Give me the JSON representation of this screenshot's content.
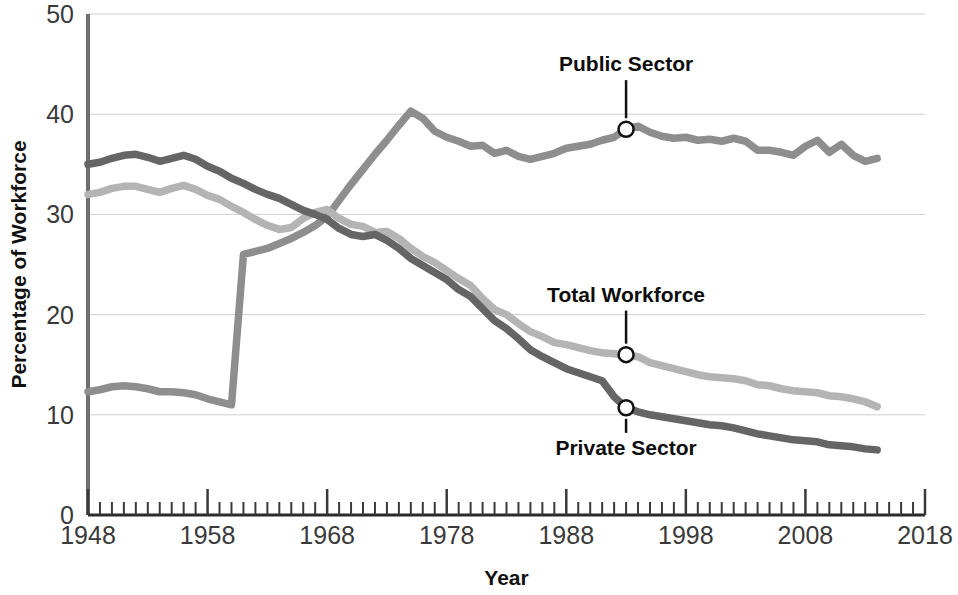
{
  "chart_data": {
    "type": "line",
    "title": "",
    "subtitle": "",
    "xlabel": "Year",
    "ylabel": "Percentage of Workforce",
    "xlim": [
      1948,
      2018
    ],
    "ylim": [
      0,
      50
    ],
    "x_major_ticks": [
      1948,
      1958,
      1968,
      1978,
      1988,
      1998,
      2008,
      2018
    ],
    "x_tick_labels": [
      "1948",
      "1958",
      "1968",
      "1978",
      "1988",
      "1998",
      "2008",
      "2018"
    ],
    "x_minor_tick_step": 1,
    "y_ticks": [
      0,
      10,
      20,
      30,
      40,
      50
    ],
    "y_tick_labels": [
      "0",
      "10",
      "20",
      "30",
      "40",
      "50"
    ],
    "grid": "horizontal",
    "legend_position": "inline-annotations",
    "colors": {
      "public_sector": "#8e8e8e",
      "total_workforce": "#b4b4b4",
      "private_sector": "#656565",
      "gridline": "#cfcfcf",
      "axis": "#6e6e6e",
      "text": "#111111"
    },
    "series": [
      {
        "name": "Public Sector",
        "color": "#8e8e8e",
        "annotation": {
          "label": "Public Sector",
          "marker_year": 1993,
          "marker_value": 38.5,
          "label_x": 1993,
          "label_y": 44.3
        },
        "x": [
          1948,
          1949,
          1950,
          1951,
          1952,
          1953,
          1954,
          1955,
          1956,
          1957,
          1958,
          1959,
          1960,
          1961,
          1962,
          1963,
          1964,
          1965,
          1966,
          1967,
          1968,
          1969,
          1970,
          1971,
          1972,
          1973,
          1974,
          1975,
          1976,
          1977,
          1978,
          1979,
          1980,
          1981,
          1982,
          1983,
          1984,
          1985,
          1986,
          1987,
          1988,
          1989,
          1990,
          1991,
          1992,
          1993,
          1994,
          1995,
          1996,
          1997,
          1998,
          1999,
          2000,
          2001,
          2002,
          2003,
          2004,
          2005,
          2006,
          2007,
          2008,
          2009,
          2010,
          2011,
          2012,
          2013,
          2014
        ],
        "values": [
          12.3,
          12.5,
          12.8,
          12.9,
          12.8,
          12.6,
          12.3,
          12.3,
          12.2,
          12.0,
          11.6,
          11.3,
          11.0,
          26.0,
          26.3,
          26.6,
          27.1,
          27.6,
          28.2,
          28.9,
          29.8,
          31.4,
          33.0,
          34.5,
          36.0,
          37.4,
          38.9,
          40.3,
          39.6,
          38.3,
          37.7,
          37.3,
          36.8,
          36.9,
          36.1,
          36.4,
          35.8,
          35.5,
          35.8,
          36.1,
          36.6,
          36.8,
          37.0,
          37.4,
          37.7,
          38.5,
          38.8,
          38.2,
          37.8,
          37.6,
          37.7,
          37.4,
          37.5,
          37.3,
          37.6,
          37.3,
          36.4,
          36.4,
          36.2,
          35.9,
          36.8,
          37.4,
          36.2,
          37.0,
          35.9,
          35.3,
          35.6
        ]
      },
      {
        "name": "Total Workforce",
        "color": "#b4b4b4",
        "annotation": {
          "label": "Total  Workforce",
          "marker_year": 1993,
          "marker_value": 16.0,
          "label_x": 1993,
          "label_y": 21.3
        },
        "x": [
          1948,
          1949,
          1950,
          1951,
          1952,
          1953,
          1954,
          1955,
          1956,
          1957,
          1958,
          1959,
          1960,
          1961,
          1962,
          1963,
          1964,
          1965,
          1966,
          1967,
          1968,
          1969,
          1970,
          1971,
          1972,
          1973,
          1974,
          1975,
          1976,
          1977,
          1978,
          1979,
          1980,
          1981,
          1982,
          1983,
          1984,
          1985,
          1986,
          1987,
          1988,
          1989,
          1990,
          1991,
          1992,
          1993,
          1994,
          1995,
          1996,
          1997,
          1998,
          1999,
          2000,
          2001,
          2002,
          2003,
          2004,
          2005,
          2006,
          2007,
          2008,
          2009,
          2010,
          2011,
          2012,
          2013,
          2014
        ],
        "values": [
          32.0,
          32.2,
          32.6,
          32.8,
          32.8,
          32.5,
          32.2,
          32.6,
          32.9,
          32.5,
          31.9,
          31.5,
          30.8,
          30.2,
          29.5,
          28.9,
          28.5,
          28.7,
          29.6,
          30.2,
          30.5,
          29.6,
          29.0,
          28.8,
          28.2,
          28.3,
          27.6,
          26.6,
          25.8,
          25.2,
          24.4,
          23.6,
          22.9,
          21.6,
          20.5,
          20.0,
          19.1,
          18.3,
          17.8,
          17.2,
          17.0,
          16.7,
          16.4,
          16.2,
          16.1,
          16.0,
          15.8,
          15.2,
          14.9,
          14.6,
          14.3,
          14.0,
          13.8,
          13.7,
          13.6,
          13.4,
          13.0,
          12.9,
          12.6,
          12.4,
          12.3,
          12.2,
          11.9,
          11.8,
          11.6,
          11.3,
          10.8
        ]
      },
      {
        "name": "Private Sector",
        "color": "#656565",
        "annotation": {
          "label": "Private Sector",
          "marker_year": 1993,
          "marker_value": 10.7,
          "label_x": 1993,
          "label_y": 6.0
        },
        "x": [
          1948,
          1949,
          1950,
          1951,
          1952,
          1953,
          1954,
          1955,
          1956,
          1957,
          1958,
          1959,
          1960,
          1961,
          1962,
          1963,
          1964,
          1965,
          1966,
          1967,
          1968,
          1969,
          1970,
          1971,
          1972,
          1973,
          1974,
          1975,
          1976,
          1977,
          1978,
          1979,
          1980,
          1981,
          1982,
          1983,
          1984,
          1985,
          1986,
          1987,
          1988,
          1989,
          1990,
          1991,
          1992,
          1993,
          1994,
          1995,
          1996,
          1997,
          1998,
          1999,
          2000,
          2001,
          2002,
          2003,
          2004,
          2005,
          2006,
          2007,
          2008,
          2009,
          2010,
          2011,
          2012,
          2013,
          2014
        ],
        "values": [
          35.0,
          35.2,
          35.6,
          35.9,
          36.0,
          35.7,
          35.3,
          35.6,
          35.9,
          35.5,
          34.8,
          34.3,
          33.6,
          33.1,
          32.5,
          32.0,
          31.6,
          31.0,
          30.4,
          30.0,
          29.5,
          28.6,
          28.0,
          27.8,
          28.0,
          27.4,
          26.6,
          25.6,
          24.9,
          24.2,
          23.5,
          22.5,
          21.8,
          20.6,
          19.4,
          18.6,
          17.6,
          16.5,
          15.8,
          15.2,
          14.6,
          14.2,
          13.8,
          13.4,
          11.8,
          10.7,
          10.3,
          10.0,
          9.8,
          9.6,
          9.4,
          9.2,
          9.0,
          8.9,
          8.7,
          8.4,
          8.1,
          7.9,
          7.7,
          7.5,
          7.4,
          7.3,
          7.0,
          6.9,
          6.8,
          6.6,
          6.5
        ]
      }
    ]
  },
  "axis": {
    "y_title": "Percentage of Workforce",
    "x_title": "Year",
    "y_labels": [
      "50",
      "40",
      "30",
      "20",
      "10",
      "0"
    ],
    "x_labels": [
      "1948",
      "1958",
      "1968",
      "1978",
      "1988",
      "1998",
      "2008",
      "2018"
    ]
  },
  "annotations": {
    "public": "Public Sector",
    "total": "Total  Workforce",
    "private": "Private Sector"
  }
}
